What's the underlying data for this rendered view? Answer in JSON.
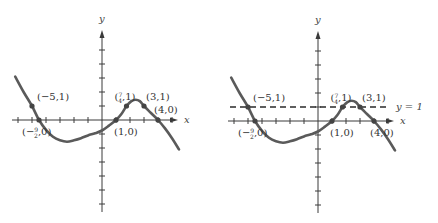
{
  "chart_data": [
    {
      "type": "line",
      "title": "",
      "xlabel": "x",
      "ylabel": "y",
      "xlim": [
        -6.5,
        6
      ],
      "ylim": [
        -6,
        6
      ],
      "x_ticks": [
        -6,
        -5,
        -4,
        -3,
        -2,
        -1,
        1,
        2,
        3,
        4,
        5
      ],
      "y_ticks": [
        -6,
        -5,
        -4,
        -3,
        -2,
        -1,
        1,
        2,
        3,
        4,
        5
      ],
      "curve": {
        "x": [
          -6.2,
          -5.6,
          -5,
          -4.5,
          -4,
          -3.5,
          -3,
          -2.5,
          -2,
          -1.5,
          -1,
          -0.5,
          0,
          0.5,
          1,
          1.4,
          1.75,
          2.1,
          2.4,
          2.7,
          3,
          3.5,
          4,
          4.5,
          5,
          5.5
        ],
        "y": [
          3.1,
          2.0,
          1,
          0,
          -0.7,
          -1.2,
          -1.45,
          -1.55,
          -1.45,
          -1.3,
          -1.1,
          -0.95,
          -0.75,
          -0.4,
          0,
          0.45,
          1,
          1.35,
          1.45,
          1.35,
          1,
          0.5,
          0,
          -0.6,
          -1.3,
          -2.1
        ]
      },
      "marked_points": [
        {
          "x": -5,
          "y": 1,
          "label": "(−5,1)"
        },
        {
          "x": -4.5,
          "y": 0,
          "label_num": "9",
          "label_den": "2",
          "label_prefix": "(−",
          "label_suffix": ",0)"
        },
        {
          "x": 1.75,
          "y": 1,
          "label_num": "7",
          "label_den": "4",
          "label_prefix": "(",
          "label_suffix": ",1)"
        },
        {
          "x": 3,
          "y": 1,
          "label": "(3,1)"
        },
        {
          "x": 1,
          "y": 0,
          "label": "(1,0)"
        },
        {
          "x": 4,
          "y": 0,
          "label": "(4,0)"
        }
      ],
      "horizontal_line": null
    },
    {
      "type": "line",
      "title": "",
      "xlabel": "x",
      "ylabel": "y",
      "xlim": [
        -6.5,
        6
      ],
      "ylim": [
        -6,
        6
      ],
      "x_ticks": [
        -6,
        -5,
        -4,
        -3,
        -2,
        -1,
        1,
        2,
        3,
        4,
        5
      ],
      "y_ticks": [
        -6,
        -5,
        -4,
        -3,
        -2,
        -1,
        1,
        2,
        3,
        4,
        5
      ],
      "curve": {
        "x": [
          -6.2,
          -5.6,
          -5,
          -4.5,
          -4,
          -3.5,
          -3,
          -2.5,
          -2,
          -1.5,
          -1,
          -0.5,
          0,
          0.5,
          1,
          1.4,
          1.75,
          2.1,
          2.4,
          2.7,
          3,
          3.5,
          4,
          4.5,
          5,
          5.5
        ],
        "y": [
          3.1,
          2.0,
          1,
          0,
          -0.7,
          -1.2,
          -1.45,
          -1.55,
          -1.45,
          -1.3,
          -1.1,
          -0.95,
          -0.75,
          -0.4,
          0,
          0.45,
          1,
          1.35,
          1.45,
          1.35,
          1,
          0.5,
          0,
          -0.6,
          -1.3,
          -2.1
        ]
      },
      "marked_points": [
        {
          "x": -5,
          "y": 1,
          "label": "(−5,1)"
        },
        {
          "x": -4.5,
          "y": 0,
          "label_num": "9",
          "label_den": "2",
          "label_prefix": "(−",
          "label_suffix": ",0)"
        },
        {
          "x": 1.75,
          "y": 1,
          "label_num": "7",
          "label_den": "4",
          "label_prefix": "(",
          "label_suffix": ",1)"
        },
        {
          "x": 3,
          "y": 1,
          "label": "(3,1)"
        },
        {
          "x": 1,
          "y": 0,
          "label": "(1,0)"
        },
        {
          "x": 4,
          "y": 0,
          "label": "(4,0)"
        }
      ],
      "horizontal_line": {
        "y": 1,
        "label": "y = 1",
        "style": "dashed"
      }
    }
  ],
  "colors": {
    "curve": "#5a5a5a",
    "axis": "#3a3a3a",
    "text": "#333333"
  }
}
